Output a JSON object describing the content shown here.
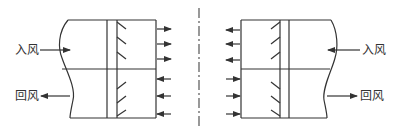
{
  "diagram": {
    "left_unit": {
      "supply_label": "入风",
      "return_label": "回风",
      "outlet_arrows_top": 3,
      "inlet_arrows_bottom": 3,
      "dampers_top": 3,
      "dampers_bottom": 3
    },
    "right_unit": {
      "supply_label": "入风",
      "return_label": "回风",
      "outlet_arrows_top": 3,
      "inlet_arrows_bottom": 3,
      "dampers_top": 3,
      "dampers_bottom": 3
    },
    "centerline": "dash-dot",
    "colors": {
      "stroke": "#333333",
      "background": "#ffffff"
    }
  }
}
